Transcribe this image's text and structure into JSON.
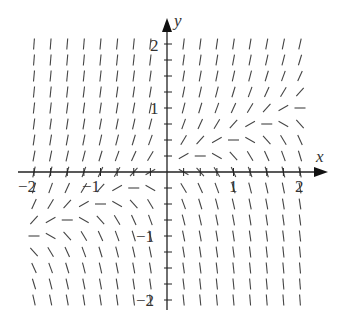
{
  "diagram": {
    "type": "slope_field",
    "axes": {
      "x_label": "x",
      "y_label": "y",
      "x_ticks": [
        {
          "value": -2,
          "label": "−2"
        },
        {
          "value": -1,
          "label": "−1"
        },
        {
          "value": 1,
          "label": "1"
        },
        {
          "value": 2,
          "label": "2"
        }
      ],
      "y_ticks": [
        {
          "value": 2,
          "label": "2"
        },
        {
          "value": 1,
          "label": "1"
        },
        {
          "value": -1,
          "label": "−1"
        },
        {
          "value": -2,
          "label": "−2"
        }
      ],
      "x_range": [
        -2,
        2
      ],
      "y_range": [
        -2,
        2
      ],
      "grid_step": 0.25
    },
    "slope_rule": "dy/dx proportional to (2y - x)",
    "colors": {
      "axis": "#222222",
      "segment": "#444444",
      "background": "#ffffff"
    }
  }
}
